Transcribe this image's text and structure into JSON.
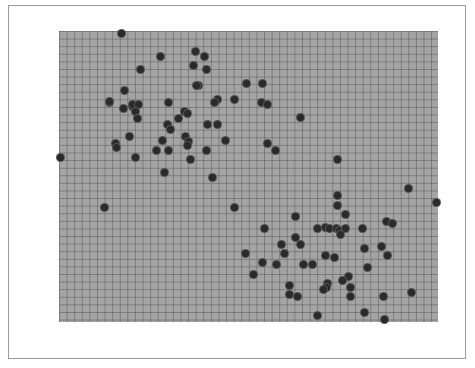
{
  "chart_data": {
    "type": "scatter",
    "title": "",
    "xlabel": "",
    "ylabel": "",
    "xlim": [
      0,
      100
    ],
    "ylim": [
      0,
      100
    ],
    "grid": true,
    "legend": null,
    "colors": {
      "background": "#a4a4a4",
      "grid": "#5a5a5a",
      "point": "#2a2a2a",
      "frame": "#9a9a9a"
    },
    "plot_box_px": {
      "left": 59,
      "top": 31,
      "width": 379,
      "height": 291
    },
    "series": [
      {
        "name": "points",
        "points": [
          [
            16.6,
            99.3
          ],
          [
            26.9,
            91.4
          ],
          [
            21.6,
            86.9
          ],
          [
            36.1,
            92.8
          ],
          [
            38.3,
            91.1
          ],
          [
            35.6,
            88.0
          ],
          [
            39.0,
            86.9
          ],
          [
            36.7,
            81.4
          ],
          [
            17.4,
            79.7
          ],
          [
            13.2,
            75.6
          ],
          [
            19.5,
            74.2
          ],
          [
            13.2,
            75.9
          ],
          [
            16.9,
            73.5
          ],
          [
            19.5,
            74.9
          ],
          [
            21.1,
            74.9
          ],
          [
            20.1,
            72.5
          ],
          [
            20.8,
            70.1
          ],
          [
            28.8,
            75.3
          ],
          [
            33.2,
            72.5
          ],
          [
            34.0,
            71.5
          ],
          [
            31.4,
            69.8
          ],
          [
            28.5,
            67.7
          ],
          [
            29.3,
            66.3
          ],
          [
            18.7,
            63.6
          ],
          [
            14.8,
            61.2
          ],
          [
            15.3,
            59.8
          ],
          [
            27.2,
            62.5
          ],
          [
            33.5,
            63.6
          ],
          [
            34.3,
            61.9
          ],
          [
            34.0,
            60.8
          ],
          [
            25.6,
            58.8
          ],
          [
            28.8,
            58.8
          ],
          [
            20.1,
            56.7
          ],
          [
            34.8,
            56.0
          ],
          [
            38.8,
            59.1
          ],
          [
            27.9,
            51.5
          ],
          [
            40.6,
            49.8
          ],
          [
            36.4,
            81.4
          ],
          [
            49.6,
            81.8
          ],
          [
            53.8,
            82.1
          ],
          [
            41.7,
            76.6
          ],
          [
            40.9,
            75.6
          ],
          [
            46.2,
            76.6
          ],
          [
            53.3,
            75.3
          ],
          [
            55.1,
            74.9
          ],
          [
            63.6,
            70.4
          ],
          [
            39.3,
            67.7
          ],
          [
            41.7,
            67.7
          ],
          [
            43.8,
            62.5
          ],
          [
            55.1,
            61.5
          ],
          [
            57.0,
            59.1
          ],
          [
            0.5,
            56.7
          ],
          [
            12.1,
            39.2
          ],
          [
            46.4,
            39.5
          ],
          [
            73.4,
            55.7
          ],
          [
            92.1,
            46.0
          ],
          [
            99.5,
            41.2
          ],
          [
            73.4,
            43.3
          ],
          [
            73.6,
            40.2
          ],
          [
            75.5,
            37.1
          ],
          [
            62.3,
            36.4
          ],
          [
            54.1,
            32.3
          ],
          [
            68.1,
            32.3
          ],
          [
            70.2,
            32.6
          ],
          [
            71.5,
            32.3
          ],
          [
            73.1,
            32.3
          ],
          [
            74.1,
            31.3
          ],
          [
            75.5,
            32.3
          ],
          [
            74.4,
            29.9
          ],
          [
            62.3,
            29.2
          ],
          [
            58.8,
            26.8
          ],
          [
            63.6,
            26.8
          ],
          [
            59.6,
            23.7
          ],
          [
            49.3,
            23.4
          ],
          [
            53.6,
            20.6
          ],
          [
            57.3,
            19.6
          ],
          [
            64.4,
            19.9
          ],
          [
            67.0,
            19.6
          ],
          [
            70.2,
            23.0
          ],
          [
            72.6,
            22.3
          ],
          [
            86.3,
            34.4
          ],
          [
            87.9,
            33.7
          ],
          [
            80.2,
            32.3
          ],
          [
            85.2,
            25.8
          ],
          [
            80.5,
            25.4
          ],
          [
            86.8,
            22.7
          ],
          [
            81.3,
            18.6
          ],
          [
            51.2,
            16.2
          ],
          [
            76.5,
            15.5
          ],
          [
            74.7,
            14.4
          ],
          [
            70.9,
            13.1
          ],
          [
            70.7,
            11.7
          ],
          [
            60.7,
            12.4
          ],
          [
            69.9,
            11.3
          ],
          [
            85.5,
            8.6
          ],
          [
            93.1,
            10.3
          ],
          [
            60.7,
            9.6
          ],
          [
            62.8,
            8.9
          ],
          [
            76.8,
            11.7
          ],
          [
            77.0,
            8.9
          ],
          [
            68.3,
            2.1
          ],
          [
            80.5,
            3.4
          ],
          [
            85.8,
            0.7
          ]
        ]
      }
    ]
  }
}
